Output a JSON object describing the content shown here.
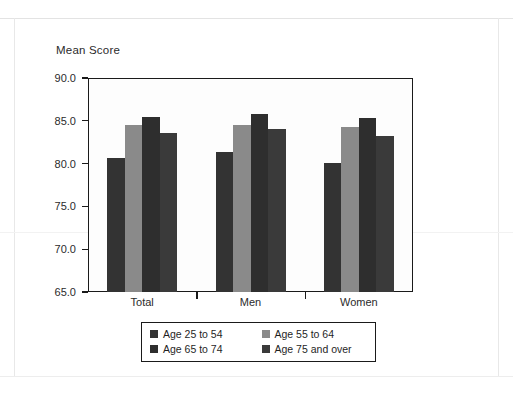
{
  "chart_data": {
    "type": "bar",
    "title": "",
    "ylabel": "Mean Score",
    "xlabel": "",
    "ylim": [
      65.0,
      90.0
    ],
    "yticks": [
      65.0,
      70.0,
      75.0,
      80.0,
      85.0,
      90.0
    ],
    "ytick_labels": [
      "65.0",
      "70.0",
      "75.0",
      "80.0",
      "85.0",
      "90.0"
    ],
    "categories": [
      "Total",
      "Men",
      "Women"
    ],
    "grid": false,
    "legend_position": "below-plot",
    "series": [
      {
        "name": "Age 25 to 54",
        "color": "#333333",
        "values": [
          80.7,
          81.3,
          80.1
        ]
      },
      {
        "name": "Age 55 to 64",
        "color": "#8a8a8a",
        "values": [
          84.5,
          84.5,
          84.3
        ]
      },
      {
        "name": "Age 65 to 74",
        "color": "#2e2e2e",
        "values": [
          85.5,
          85.8,
          85.3
        ]
      },
      {
        "name": "Age 75 and over",
        "color": "#3a3a3a",
        "values": [
          83.6,
          84.0,
          83.2
        ]
      }
    ]
  },
  "legend": {
    "items": [
      {
        "label": "Age 25 to 54"
      },
      {
        "label": "Age 55 to 64"
      },
      {
        "label": "Age 65 to 74"
      },
      {
        "label": "Age 75 and over"
      }
    ]
  }
}
